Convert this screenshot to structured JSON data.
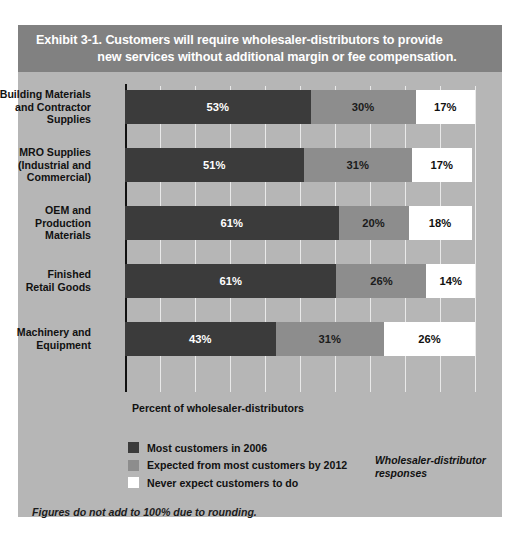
{
  "header": {
    "title_line1": "Exhibit 3-1. Customers will require wholesaler-distributors to provide",
    "title_line2": "new services without additional margin or fee compensation."
  },
  "axis_caption": "Percent of wholesaler-distributors",
  "responses_note_line1": "Wholesaler-distributor",
  "responses_note_line2": "responses",
  "footnote": "Figures do not add to 100% due to rounding.",
  "colors": {
    "card_background": "#b6b6b6",
    "header_band": "#818181",
    "gridline": "#e9e9e9",
    "axis_line": "#111111",
    "most_customers": "#3b3b3b",
    "expected_by_2012": "#8d8d8d",
    "never_expect": "#ffffff"
  },
  "legend": [
    {
      "label": "Most customers in 2006",
      "color": "#3b3b3b"
    },
    {
      "label": "Expected from most customers by 2012",
      "color": "#8d8d8d"
    },
    {
      "label": "Never expect customers to do",
      "color": "#ffffff"
    }
  ],
  "chart_data": {
    "type": "bar",
    "orientation": "horizontal",
    "stacked": true,
    "title": "Exhibit 3-1. Customers will require wholesaler-distributors to provide new services without additional margin or fee compensation.",
    "xlabel": "Percent of wholesaler-distributors",
    "ylabel": "",
    "xlim": [
      0,
      100
    ],
    "xticks": [
      0,
      10,
      20,
      30,
      40,
      50,
      60,
      70,
      80,
      90,
      100
    ],
    "grid": true,
    "legend_position": "bottom-left",
    "categories": [
      "Building Materials and Contractor Supplies",
      "MRO Supplies (Industrial and Commercial)",
      "OEM and Production Materials",
      "Finished Retail Goods",
      "Machinery and Equipment"
    ],
    "category_lines": [
      [
        "Building Materials",
        "and Contractor",
        "Supplies"
      ],
      [
        "MRO Supplies",
        "(Industrial and",
        "Commercial)"
      ],
      [
        "OEM and",
        "Production",
        "Materials"
      ],
      [
        "Finished",
        "Retail Goods"
      ],
      [
        "Machinery and",
        "Equipment"
      ]
    ],
    "series": [
      {
        "name": "Most customers in 2006",
        "color": "#3b3b3b",
        "values": [
          53,
          51,
          61,
          61,
          43
        ]
      },
      {
        "name": "Expected from most customers by 2012",
        "color": "#8d8d8d",
        "values": [
          30,
          31,
          20,
          26,
          31
        ]
      },
      {
        "name": "Never expect customers to do",
        "color": "#ffffff",
        "values": [
          17,
          17,
          18,
          14,
          26
        ]
      }
    ],
    "data_labels": [
      [
        "53%",
        "30%",
        "17%"
      ],
      [
        "51%",
        "31%",
        "17%"
      ],
      [
        "61%",
        "20%",
        "18%"
      ],
      [
        "61%",
        "26%",
        "14%"
      ],
      [
        "43%",
        "31%",
        "26%"
      ]
    ],
    "annotation": "Figures do not add to 100% due to rounding.",
    "note": "Wholesaler-distributor responses"
  }
}
